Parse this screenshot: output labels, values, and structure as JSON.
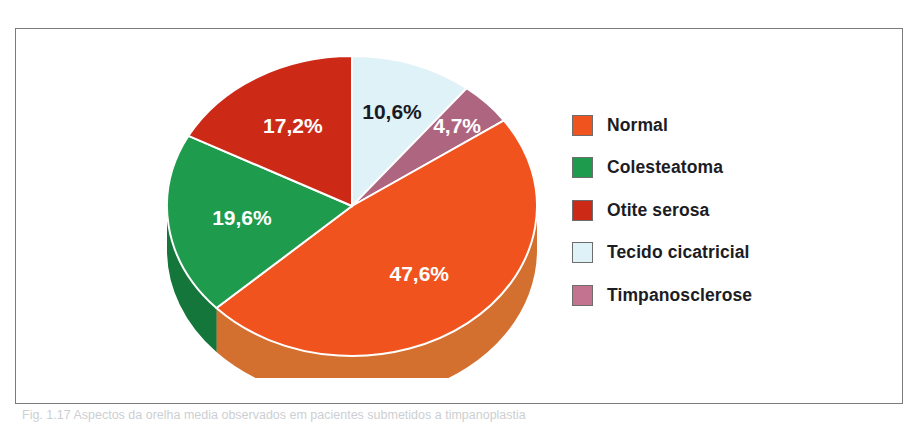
{
  "figure": {
    "frame_color": "#7b7b7b",
    "background": "#ffffff",
    "caption_prefix": "Fig. 1.17",
    "caption_text": "Fig. 1.17  Aspectos da orelha media observados em pacientes submetidos a timpanoplastia"
  },
  "chart_data": {
    "type": "pie",
    "title": "",
    "subtitle": "",
    "xlabel": "",
    "ylabel": "",
    "legend_position": "right",
    "grid": false,
    "three_d": true,
    "start_angle_deg": 0,
    "direction": "clockwise",
    "categories": [
      "Tecido cicatricial",
      "Timpanosclerose",
      "Normal",
      "Colesteatoma",
      "Otite serosa"
    ],
    "values": [
      10.6,
      4.7,
      47.6,
      19.6,
      17.2
    ],
    "value_labels": [
      "10,6%",
      "4,7%",
      "47,6%",
      "19,6%",
      "17,2%"
    ],
    "colors": [
      "#dff2f7",
      "#ad6580",
      "#f0531e",
      "#1e9b4c",
      "#cc2a17"
    ],
    "label_text_colors": [
      "#1a1a24",
      "#ffffff",
      "#ffffff",
      "#ffffff",
      "#ffffff"
    ],
    "units": "percent",
    "total": 99.7
  },
  "slices": [
    {
      "name": "Tecido cicatricial",
      "value": 10.6,
      "label": "10,6%",
      "color": "#dff2f7",
      "side_color": "#b9dde6",
      "text_color": "#1a1a24"
    },
    {
      "name": "Timpanosclerose",
      "value": 4.7,
      "label": "4,7%",
      "color": "#ad6580",
      "side_color": "#8d4a63",
      "text_color": "#ffffff"
    },
    {
      "name": "Normal",
      "value": 47.6,
      "label": "47,6%",
      "color": "#f0531e",
      "side_color": "#d4702f",
      "text_color": "#ffffff"
    },
    {
      "name": "Colesteatoma",
      "value": 19.6,
      "label": "19,6%",
      "color": "#1e9b4c",
      "side_color": "#14763a",
      "text_color": "#ffffff"
    },
    {
      "name": "Otite serosa",
      "value": 17.2,
      "label": "17,2%",
      "color": "#cc2a17",
      "side_color": "#a32113",
      "text_color": "#ffffff"
    }
  ],
  "legend": {
    "items": [
      {
        "label": "Normal",
        "color": "#f0531e"
      },
      {
        "label": "Colesteatoma",
        "color": "#1e9b4c"
      },
      {
        "label": "Otite serosa",
        "color": "#cc2a17"
      },
      {
        "label": "Tecido cicatricial",
        "color": "#dff2f7"
      },
      {
        "label": "Timpanosclerose",
        "color": "#c3738f"
      }
    ]
  }
}
